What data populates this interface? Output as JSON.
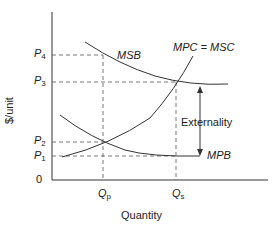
{
  "diagram": {
    "type": "economics-externality",
    "axes": {
      "y_label": "$/unit",
      "x_label": "Quantity",
      "origin_label": "0"
    },
    "price_ticks": [
      {
        "letter": "P",
        "sub": "4"
      },
      {
        "letter": "P",
        "sub": "3"
      },
      {
        "letter": "P",
        "sub": "2"
      },
      {
        "letter": "P",
        "sub": "1"
      }
    ],
    "quantity_ticks": [
      {
        "letter": "Q",
        "sub": "p"
      },
      {
        "letter": "Q",
        "sub": "s"
      }
    ],
    "curves": {
      "msb": "MSB",
      "mpc_msc": "MPC = MSC",
      "mpb": "MPB"
    },
    "annotation": "Externality",
    "colors": {
      "line": "#333333",
      "dash": "#555555",
      "text": "#222222"
    }
  }
}
